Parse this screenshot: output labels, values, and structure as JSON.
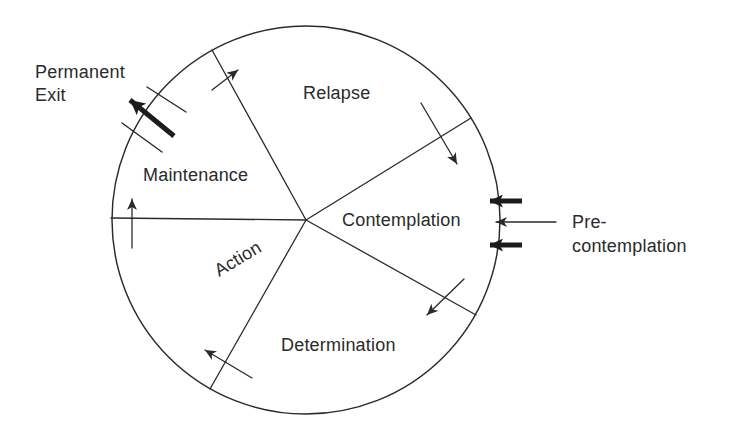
{
  "colors": {
    "ink": "#2a2a2a",
    "background": "#ffffff"
  },
  "wheel": {
    "stages": {
      "relapse": "Relapse",
      "contemplation": "Contemplation",
      "determination": "Determination",
      "action": "Action",
      "maintenance": "Maintenance"
    },
    "permanent_exit": {
      "line1": "Permanent",
      "line2": "Exit"
    },
    "precontemplation": {
      "line1": "Pre-",
      "line2": "contemplation"
    },
    "icons": {
      "permanent_exit_arrow": "thick-arrow-out-upper-left",
      "exit_gate_marks": "two-parallel-gate-lines",
      "entry_arrow_top": "thick-arrow-pointing-left",
      "entry_arrow_middle": "thin-arrow-pointing-left",
      "entry_arrow_bottom": "thick-arrow-pointing-left",
      "transition_arrows": "thin-clockwise-arrows-crossing-sector-boundaries"
    }
  }
}
